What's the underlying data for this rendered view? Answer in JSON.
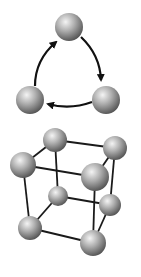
{
  "canvas": {
    "width": 141,
    "height": 277,
    "background": "#ffffff"
  },
  "colors": {
    "sphere_light": "#f2f2f2",
    "sphere_mid": "#a8a8a8",
    "sphere_dark": "#5a5a5a",
    "line": "#1a1a1a"
  },
  "cycle_diagram": {
    "description": "Three spheres connected by curved arrows in a clockwise cycle",
    "nodes": [
      {
        "id": "top",
        "cx": 69,
        "cy": 27,
        "r": 14
      },
      {
        "id": "bottom-right",
        "cx": 106,
        "cy": 100,
        "r": 14
      },
      {
        "id": "bottom-left",
        "cx": 30,
        "cy": 100,
        "r": 14
      }
    ],
    "arrows": [
      {
        "from": "top",
        "to": "bottom-right"
      },
      {
        "from": "bottom-right",
        "to": "bottom-left"
      },
      {
        "from": "bottom-left",
        "to": "top"
      }
    ]
  },
  "cube_diagram": {
    "description": "Cubic lattice of eight spheres connected by edges",
    "nodes": [
      {
        "id": "back-top-left",
        "cx": 55,
        "cy": 140,
        "r": 12
      },
      {
        "id": "back-top-right",
        "cx": 115,
        "cy": 148,
        "r": 12
      },
      {
        "id": "front-top-left",
        "cx": 23,
        "cy": 165,
        "r": 13
      },
      {
        "id": "front-top-right",
        "cx": 95,
        "cy": 177,
        "r": 14
      },
      {
        "id": "back-bottom-left",
        "cx": 58,
        "cy": 196,
        "r": 10
      },
      {
        "id": "back-bottom-right",
        "cx": 110,
        "cy": 205,
        "r": 11
      },
      {
        "id": "front-bottom-left",
        "cx": 30,
        "cy": 228,
        "r": 12
      },
      {
        "id": "front-bottom-right",
        "cx": 93,
        "cy": 243,
        "r": 13
      }
    ]
  }
}
